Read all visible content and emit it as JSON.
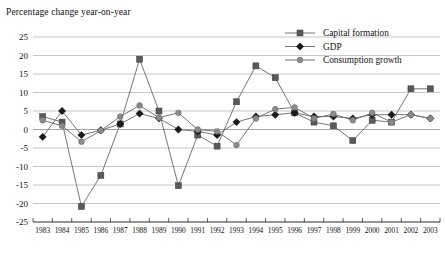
{
  "chart_data": {
    "type": "line",
    "title": "",
    "ylabel": "Percentage change year-on-year",
    "xlabel": "",
    "ylim": [
      -25,
      25
    ],
    "ytick_step": 5,
    "yticks": [
      "25",
      "20",
      "15",
      "10",
      "5",
      "0",
      "-5",
      "-10",
      "-15",
      "-20",
      "-25"
    ],
    "grid": true,
    "legend_position": "top-right",
    "categories": [
      "1983",
      "1984",
      "1985",
      "1986",
      "1987",
      "1988",
      "1989",
      "1990",
      "1991",
      "1992",
      "1993",
      "1994",
      "1995",
      "1996",
      "1997",
      "1998",
      "1999",
      "2000",
      "2001",
      "2002",
      "2003"
    ],
    "series": [
      {
        "name": "Capital formation",
        "marker": "square",
        "color": "#595959",
        "values": [
          3.5,
          2.0,
          -20.8,
          -12.4,
          1.5,
          19.0,
          5.0,
          -15.2,
          -1.5,
          -4.5,
          7.5,
          17.2,
          14.0,
          4.5,
          2.0,
          1.0,
          -3.0,
          2.5,
          2.0,
          11.0,
          11.0
        ]
      },
      {
        "name": "GDP",
        "marker": "diamond",
        "color": "#1a1a1a",
        "values": [
          -2.0,
          5.0,
          -1.5,
          -0.2,
          1.5,
          4.3,
          3.0,
          0.0,
          -0.5,
          -1.5,
          2.0,
          3.5,
          4.0,
          4.5,
          3.5,
          3.5,
          3.0,
          4.0,
          4.0,
          4.0,
          3.0
        ]
      },
      {
        "name": "Consumption growth",
        "marker": "circle",
        "color": "#8a8a8a",
        "values": [
          2.5,
          1.0,
          -3.3,
          -0.3,
          3.5,
          6.5,
          3.2,
          4.5,
          0.0,
          -0.5,
          -4.2,
          3.0,
          5.5,
          6.0,
          3.0,
          4.2,
          2.5,
          4.5,
          2.0,
          4.0,
          3.0
        ]
      }
    ]
  },
  "legend": {
    "items": [
      {
        "label": "Capital formation"
      },
      {
        "label": "GDP"
      },
      {
        "label": "Consumption growth"
      }
    ]
  }
}
